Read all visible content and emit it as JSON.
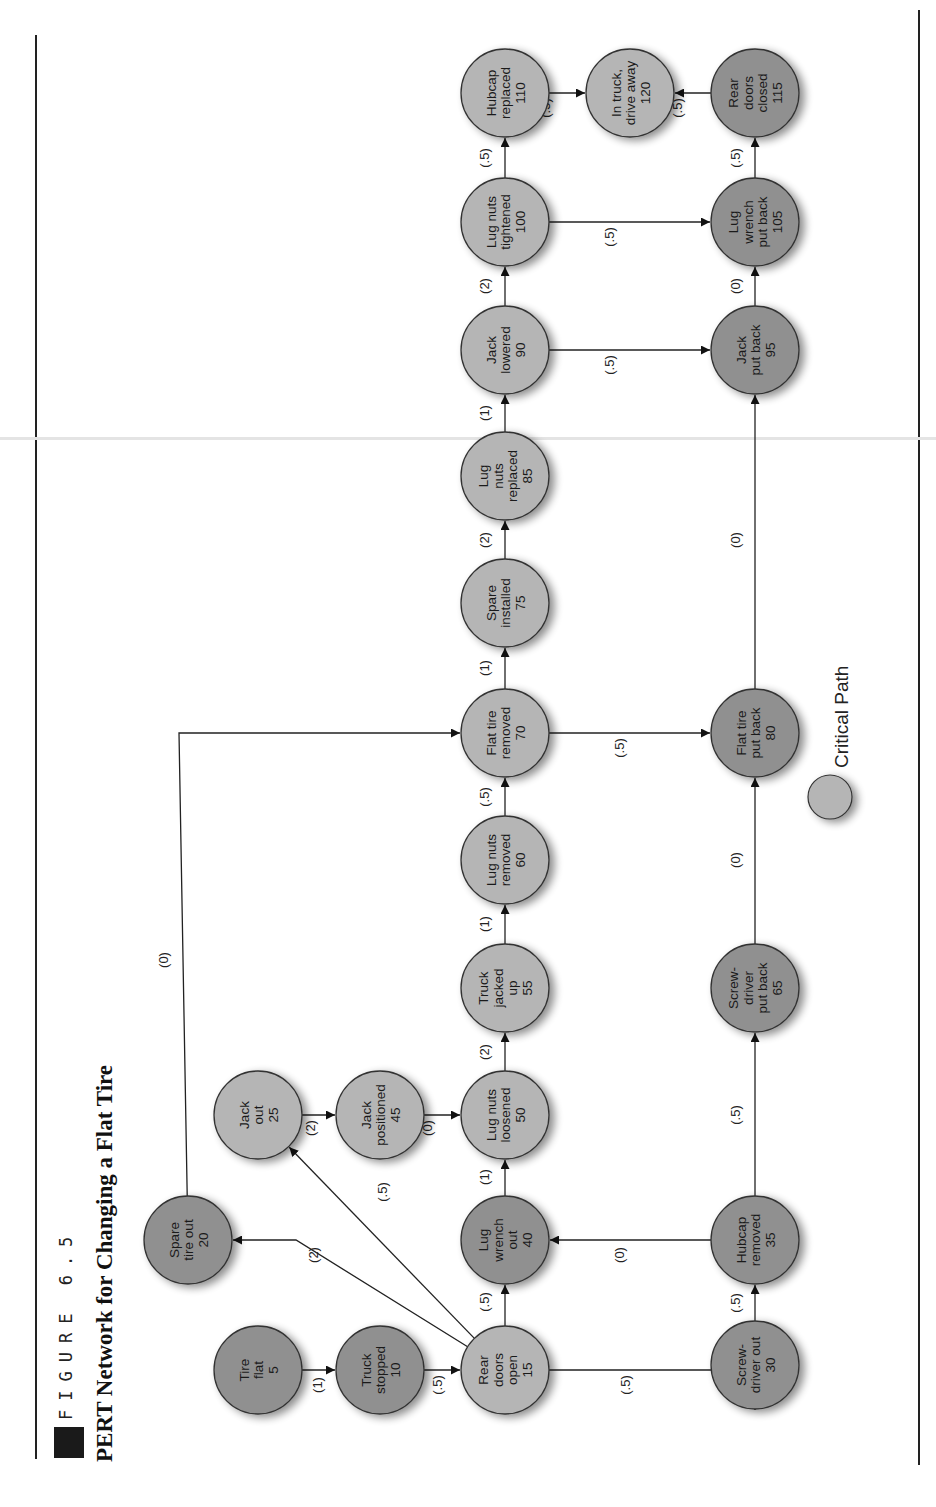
{
  "figure": {
    "label": "FIGURE 6.5",
    "title": "PERT Network for Changing a Flat Tire"
  },
  "legend": {
    "label": "Critical Path",
    "critical_color": "#b4b4b4",
    "noncritical_color": "#8f8f8f"
  },
  "colors": {
    "critical": "#b5b5b5",
    "noncritical": "#909090",
    "stroke": "#333333",
    "edge": "#222222"
  },
  "nodes": [
    {
      "id": 5,
      "lines": [
        "Tire",
        "flat",
        "5"
      ],
      "critical": false,
      "x": 258,
      "y": 1370
    },
    {
      "id": 10,
      "lines": [
        "Truck",
        "stopped",
        "10"
      ],
      "critical": false,
      "x": 380,
      "y": 1370
    },
    {
      "id": 15,
      "lines": [
        "Rear",
        "doors",
        "open",
        "15"
      ],
      "critical": true,
      "x": 505,
      "y": 1370
    },
    {
      "id": 20,
      "lines": [
        "Spare",
        "tire out",
        "20"
      ],
      "critical": false,
      "x": 188,
      "y": 1240
    },
    {
      "id": 25,
      "lines": [
        "Jack",
        "out",
        "25"
      ],
      "critical": true,
      "x": 258,
      "y": 1115
    },
    {
      "id": 30,
      "lines": [
        "Screw-",
        "driver out",
        "30"
      ],
      "critical": false,
      "x": 755,
      "y": 1365
    },
    {
      "id": 35,
      "lines": [
        "Hubcap",
        "removed",
        "35"
      ],
      "critical": false,
      "x": 755,
      "y": 1240
    },
    {
      "id": 40,
      "lines": [
        "Lug",
        "wrench",
        "out",
        "40"
      ],
      "critical": false,
      "x": 505,
      "y": 1240
    },
    {
      "id": 45,
      "lines": [
        "Jack",
        "positioned",
        "45"
      ],
      "critical": true,
      "x": 380,
      "y": 1115
    },
    {
      "id": 50,
      "lines": [
        "Lug nuts",
        "loosened",
        "50"
      ],
      "critical": true,
      "x": 505,
      "y": 1115
    },
    {
      "id": 55,
      "lines": [
        "Truck",
        "jacked",
        "up",
        "55"
      ],
      "critical": true,
      "x": 505,
      "y": 988
    },
    {
      "id": 60,
      "lines": [
        "Lug nuts",
        "removed",
        "60"
      ],
      "critical": true,
      "x": 505,
      "y": 860
    },
    {
      "id": 65,
      "lines": [
        "Screw-",
        "driver",
        "put back",
        "65"
      ],
      "critical": false,
      "x": 755,
      "y": 988
    },
    {
      "id": 70,
      "lines": [
        "Flat tire",
        "removed",
        "70"
      ],
      "critical": true,
      "x": 505,
      "y": 733
    },
    {
      "id": 75,
      "lines": [
        "Spare",
        "installed",
        "75"
      ],
      "critical": true,
      "x": 505,
      "y": 603
    },
    {
      "id": 80,
      "lines": [
        "Flat tire",
        "put back",
        "80"
      ],
      "critical": false,
      "x": 755,
      "y": 733
    },
    {
      "id": 85,
      "lines": [
        "Lug",
        "nuts",
        "replaced",
        "85"
      ],
      "critical": true,
      "x": 505,
      "y": 476
    },
    {
      "id": 90,
      "lines": [
        "Jack",
        "lowered",
        "90"
      ],
      "critical": true,
      "x": 505,
      "y": 350
    },
    {
      "id": 95,
      "lines": [
        "Jack",
        "put back",
        "95"
      ],
      "critical": false,
      "x": 755,
      "y": 350
    },
    {
      "id": 100,
      "lines": [
        "Lug nuts",
        "tightened",
        "100"
      ],
      "critical": true,
      "x": 505,
      "y": 222
    },
    {
      "id": 105,
      "lines": [
        "Lug",
        "wrench",
        "put back",
        "105"
      ],
      "critical": false,
      "x": 755,
      "y": 222
    },
    {
      "id": 110,
      "lines": [
        "Hubcap",
        "replaced",
        "110"
      ],
      "critical": true,
      "x": 505,
      "y": 93
    },
    {
      "id": 115,
      "lines": [
        "Rear",
        "doors",
        "closed",
        "115"
      ],
      "critical": false,
      "x": 755,
      "y": 93
    },
    {
      "id": 120,
      "lines": [
        "In truck,",
        "drive away",
        "120"
      ],
      "critical": true,
      "x": 630,
      "y": 93
    }
  ],
  "edges": [
    {
      "from": 5,
      "to": 10,
      "label": "(1)",
      "lx": 322,
      "ly": 1385
    },
    {
      "from": 10,
      "to": 15,
      "label": "(.5)",
      "lx": 442,
      "ly": 1385
    },
    {
      "from": 15,
      "to": 20,
      "label": "(2)",
      "lx": 318,
      "ly": 1255,
      "via": [
        [
          296,
          1240
        ]
      ]
    },
    {
      "from": 15,
      "to": 25,
      "label": "(.5)",
      "lx": 387,
      "ly": 1192
    },
    {
      "from": 15,
      "to": 40,
      "label": "(.5)",
      "lx": 489,
      "ly": 1302
    },
    {
      "from": 15,
      "to": 30,
      "label": "(.5)",
      "lx": 630,
      "ly": 1385,
      "via": [
        [
          755,
          1370
        ]
      ]
    },
    {
      "from": 20,
      "to": 70,
      "label": "(0)",
      "lx": 168,
      "ly": 960,
      "via": [
        [
          179,
          733
        ]
      ]
    },
    {
      "from": 25,
      "to": 45,
      "label": "(2)",
      "lx": 315,
      "ly": 1128
    },
    {
      "from": 45,
      "to": 50,
      "label": "(0)",
      "lx": 432,
      "ly": 1128
    },
    {
      "from": 40,
      "to": 50,
      "label": "(1)",
      "lx": 489,
      "ly": 1177
    },
    {
      "from": 35,
      "to": 40,
      "label": "(0)",
      "lx": 624,
      "ly": 1255
    },
    {
      "from": 30,
      "to": 35,
      "label": "(.5)",
      "lx": 740,
      "ly": 1303
    },
    {
      "from": 35,
      "to": 65,
      "label": "(.5)",
      "lx": 740,
      "ly": 1115,
      "via": [
        [
          755,
          1240
        ]
      ]
    },
    {
      "from": 50,
      "to": 55,
      "label": "(2)",
      "lx": 489,
      "ly": 1052
    },
    {
      "from": 55,
      "to": 60,
      "label": "(1)",
      "lx": 489,
      "ly": 924
    },
    {
      "from": 60,
      "to": 70,
      "label": "(.5)",
      "lx": 489,
      "ly": 797
    },
    {
      "from": 65,
      "to": 80,
      "label": "(0)",
      "lx": 740,
      "ly": 860
    },
    {
      "from": 70,
      "to": 75,
      "label": "(1)",
      "lx": 489,
      "ly": 668
    },
    {
      "from": 70,
      "to": 80,
      "label": "(.5)",
      "lx": 624,
      "ly": 748
    },
    {
      "from": 75,
      "to": 85,
      "label": "(2)",
      "lx": 489,
      "ly": 540
    },
    {
      "from": 80,
      "to": 95,
      "label": "(0)",
      "lx": 740,
      "ly": 540
    },
    {
      "from": 85,
      "to": 90,
      "label": "(1)",
      "lx": 489,
      "ly": 413
    },
    {
      "from": 90,
      "to": 100,
      "label": "(2)",
      "lx": 489,
      "ly": 286
    },
    {
      "from": 90,
      "to": 95,
      "label": "(.5)",
      "lx": 614,
      "ly": 365
    },
    {
      "from": 100,
      "to": 110,
      "label": "(.5)",
      "lx": 489,
      "ly": 158
    },
    {
      "from": 100,
      "to": 105,
      "label": "(.5)",
      "lx": 614,
      "ly": 237
    },
    {
      "from": 95,
      "to": 105,
      "label": "(0)",
      "lx": 740,
      "ly": 286
    },
    {
      "from": 105,
      "to": 115,
      "label": "(.5)",
      "lx": 740,
      "ly": 158
    },
    {
      "from": 110,
      "to": 120,
      "label": "(.5)",
      "lx": 550,
      "ly": 108
    },
    {
      "from": 115,
      "to": 120,
      "label": "(.5)",
      "lx": 682,
      "ly": 108
    }
  ]
}
